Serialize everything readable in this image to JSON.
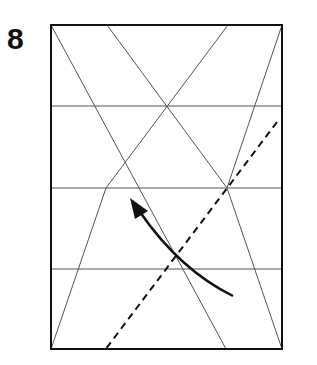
{
  "step": {
    "number": "8"
  },
  "diagram": {
    "colors": {
      "outline": "#111111",
      "crease": "#555555",
      "fold_line": "#111111",
      "arrow": "#111111"
    }
  }
}
